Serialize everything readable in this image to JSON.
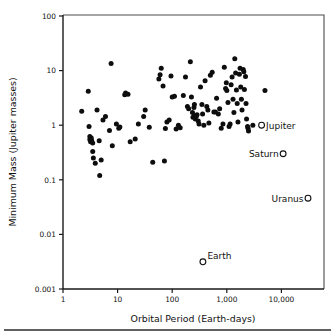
{
  "figure": {
    "background": "#ffffff",
    "ink_color": "#111111",
    "footer_rule": true
  },
  "chart_data": {
    "type": "scatter",
    "title": "",
    "xlabel": "Orbital Period (Earth-days)",
    "ylabel": "Minimum Mass (Jupiter masses)",
    "xscale": "log",
    "yscale": "log",
    "xlim": [
      1,
      60000
    ],
    "ylim": [
      0.001,
      100
    ],
    "grid": false,
    "legend": "none",
    "xticks": [
      1,
      10,
      100,
      1000,
      10000
    ],
    "xticklabels": [
      "1",
      "10",
      "100",
      "1,000",
      "10,000"
    ],
    "yticks": [
      0.001,
      0.01,
      0.1,
      1,
      10,
      100
    ],
    "yticklabels": [
      "0.001",
      "0.01",
      "0.1",
      "1",
      "10",
      "100"
    ],
    "series": [
      {
        "name": "Extrasolar planets",
        "marker": "filled-circle",
        "color": "#0d0d0d",
        "points": [
          [
            2.2,
            1.8
          ],
          [
            2.9,
            4.2
          ],
          [
            3.0,
            0.95
          ],
          [
            3.1,
            0.62
          ],
          [
            3.1,
            0.55
          ],
          [
            3.2,
            0.5
          ],
          [
            3.3,
            0.58
          ],
          [
            3.35,
            0.52
          ],
          [
            3.5,
            0.47
          ],
          [
            3.5,
            0.33
          ],
          [
            3.6,
            0.25
          ],
          [
            3.9,
            0.2
          ],
          [
            4.2,
            1.9
          ],
          [
            4.6,
            0.52
          ],
          [
            4.7,
            0.12
          ],
          [
            5.0,
            0.23
          ],
          [
            5.4,
            1.25
          ],
          [
            6.0,
            1.45
          ],
          [
            7.1,
            0.8
          ],
          [
            7.6,
            13.5
          ],
          [
            8.0,
            0.42
          ],
          [
            9.5,
            1.05
          ],
          [
            10.5,
            0.88
          ],
          [
            11.0,
            0.93
          ],
          [
            13.5,
            3.6
          ],
          [
            14.0,
            3.9
          ],
          [
            15.5,
            3.7
          ],
          [
            17.0,
            0.5
          ],
          [
            21.0,
            0.56
          ],
          [
            24.0,
            1.05
          ],
          [
            30.0,
            1.45
          ],
          [
            32.0,
            1.9
          ],
          [
            38.0,
            0.92
          ],
          [
            44.0,
            0.21
          ],
          [
            57.0,
            7.0
          ],
          [
            60.0,
            8.4
          ],
          [
            63.0,
            11.0
          ],
          [
            68.0,
            5.2
          ],
          [
            72.0,
            0.22
          ],
          [
            75.0,
            0.87
          ],
          [
            80.0,
            1.15
          ],
          [
            88.0,
            1.25
          ],
          [
            95.0,
            8.0
          ],
          [
            100.0,
            3.3
          ],
          [
            110.0,
            3.4
          ],
          [
            118.0,
            0.85
          ],
          [
            130.0,
            1.0
          ],
          [
            140.0,
            0.9
          ],
          [
            160.0,
            3.5
          ],
          [
            175.0,
            7.6
          ],
          [
            190.0,
            2.2
          ],
          [
            200.0,
            2.0
          ],
          [
            215.0,
            14.5
          ],
          [
            225.0,
            3.3
          ],
          [
            235.0,
            1.7
          ],
          [
            240.0,
            1.4
          ],
          [
            250.0,
            2.1
          ],
          [
            255.0,
            2.4
          ],
          [
            260.0,
            1.5
          ],
          [
            265.0,
            1.3
          ],
          [
            275.0,
            1.45
          ],
          [
            285.0,
            1.55
          ],
          [
            300.0,
            1.2
          ],
          [
            310.0,
            1.05
          ],
          [
            330.0,
            5.0
          ],
          [
            350.0,
            2.4
          ],
          [
            360.0,
            1.6
          ],
          [
            380.0,
            1.0
          ],
          [
            400.0,
            6.5
          ],
          [
            430.0,
            2.2
          ],
          [
            450.0,
            1.9
          ],
          [
            470.0,
            1.1
          ],
          [
            500.0,
            8.2
          ],
          [
            540.0,
            9.3
          ],
          [
            580.0,
            1.75
          ],
          [
            620.0,
            1.75
          ],
          [
            650.0,
            3.1
          ],
          [
            700.0,
            1.6
          ],
          [
            740.0,
            2.0
          ],
          [
            790.0,
            0.88
          ],
          [
            850.0,
            1.05
          ],
          [
            900.0,
            11.5
          ],
          [
            950.0,
            4.7
          ],
          [
            980.0,
            6.0
          ],
          [
            1000.0,
            4.3
          ],
          [
            1050.0,
            2.6
          ],
          [
            1100.0,
            0.95
          ],
          [
            1150.0,
            1.05
          ],
          [
            1200.0,
            5.5
          ],
          [
            1250.0,
            7.6
          ],
          [
            1300.0,
            3.0
          ],
          [
            1350.0,
            1.7
          ],
          [
            1400.0,
            16.5
          ],
          [
            1450.0,
            9.0
          ],
          [
            1500.0,
            4.4
          ],
          [
            1550.0,
            2.5
          ],
          [
            1600.0,
            1.15
          ],
          [
            1700.0,
            8.6
          ],
          [
            1750.0,
            11.0
          ],
          [
            1800.0,
            5.0
          ],
          [
            1850.0,
            3.0
          ],
          [
            1900.0,
            1.9
          ],
          [
            2000.0,
            10.5
          ],
          [
            2050.0,
            9.5
          ],
          [
            2100.0,
            4.5
          ],
          [
            2200.0,
            7.8
          ],
          [
            2250.0,
            2.5
          ],
          [
            2300.0,
            1.3
          ],
          [
            2400.0,
            0.95
          ],
          [
            2450.0,
            0.88
          ],
          [
            2500.0,
            0.78
          ],
          [
            3000.0,
            1.0
          ],
          [
            5000.0,
            4.3
          ]
        ]
      },
      {
        "name": "Solar System planets",
        "marker": "open-circle",
        "color": "#ffffff",
        "points": [
          {
            "label": "Jupiter",
            "x": 4333,
            "y": 1.0,
            "label_pos": "right"
          },
          {
            "label": "Saturn",
            "x": 10759,
            "y": 0.3,
            "label_pos": "left"
          },
          {
            "label": "Uranus",
            "x": 30685,
            "y": 0.046,
            "label_pos": "left"
          },
          {
            "label": "Earth",
            "x": 365,
            "y": 0.00315,
            "label_pos": "upper-right"
          }
        ]
      }
    ]
  }
}
